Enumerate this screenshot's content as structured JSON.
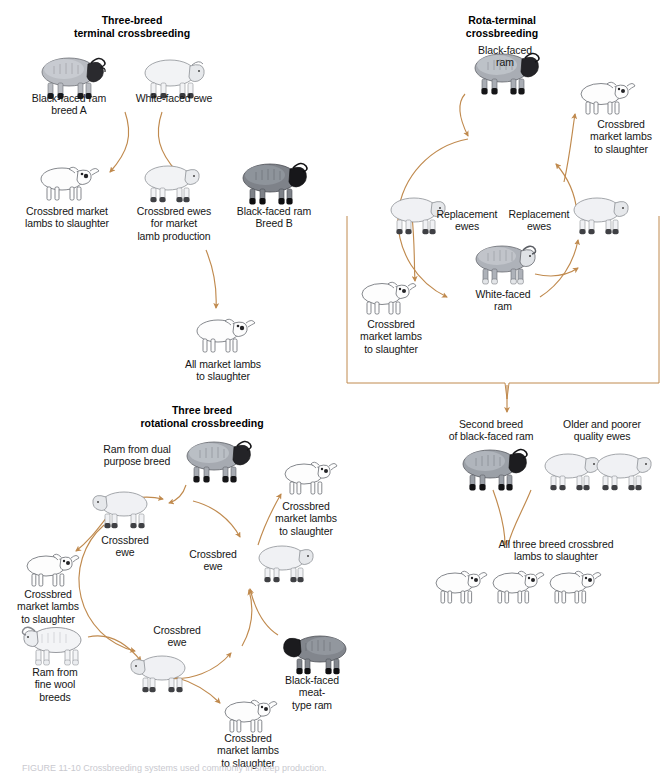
{
  "figure": {
    "caption": "FIGURE 11-10   Crossbreeding systems used commonly in sheep production.",
    "arrow_color": "#c08a4e",
    "background_color": "#ffffff"
  },
  "panels": {
    "three_breed_terminal": {
      "title": "Three-breed\nterminal crossbreeding",
      "labels": {
        "sire_a": "Black-faced ram\nbreed A",
        "dam_a": "White-faced ewe",
        "market_lambs": "Crossbred market\nlambs to slaughter",
        "crossbred_ewes": "Crossbred ewes\nfor market\nlamb production",
        "sire_b": "Black-faced ram\nBreed B",
        "final": "All market lambs\nto slaughter"
      }
    },
    "rota_terminal": {
      "title": "Rota-terminal\ncrossbreeding",
      "labels": {
        "black_faced_ram": "Black-faced\nram",
        "market_lambs_right": "Crossbred\nmarket lambs\nto slaughter",
        "replacement_ewes_left": "Replacement\newes",
        "replacement_ewes_right": "Replacement\newes",
        "white_faced_ram": "White-faced\nram",
        "market_lambs_left": "Crossbred\nmarket lambs\nto slaughter",
        "second_breed_ram": "Second breed\nof black-faced ram",
        "older_ewes": "Older and poorer\nquality ewes",
        "final": "All three breed crossbred\nlambs to slaughter"
      }
    },
    "three_breed_rotational": {
      "title": "Three breed\nrotational crossbreeding",
      "labels": {
        "dual_purpose_ram": "Ram from dual\npurpose breed",
        "market_lambs_top_right": "Crossbred\nmarket lambs\nto slaughter",
        "crossbred_ewe_upper_left": "Crossbred\newe",
        "crossbred_ewe_center": "Crossbred\newe",
        "market_lambs_left": "Crossbred\nmarket lambs\nto slaughter",
        "fine_wool_ram": "Ram from\nfine wool\nbreeds",
        "crossbred_ewe_lower": "Crossbred\newe",
        "market_lambs_bottom": "Crossbred\nmarket lambs\nto slaughter",
        "meat_type_ram": "Black-faced\nmeat-\ntype ram"
      }
    }
  }
}
